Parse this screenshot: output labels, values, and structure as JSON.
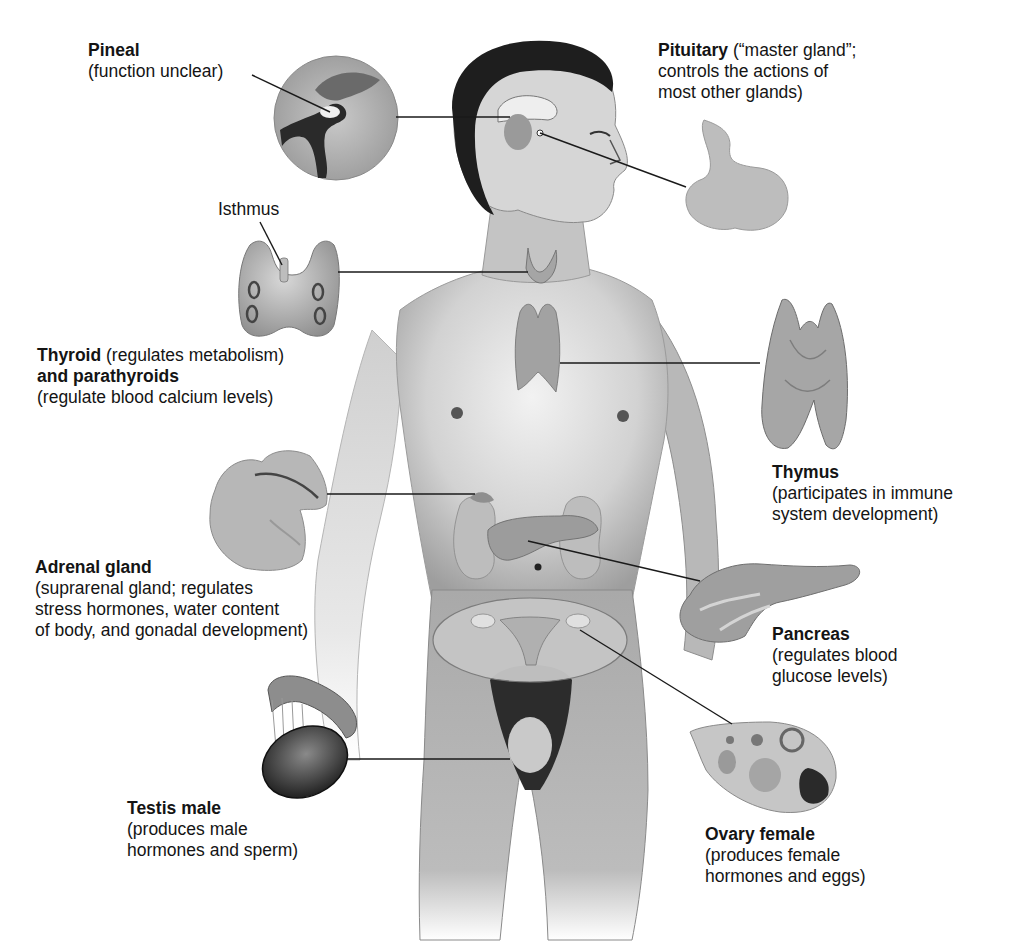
{
  "diagram": {
    "type": "anatomical-labeled-illustration",
    "colors": {
      "background": "#ffffff",
      "text": "#141414",
      "leader_line": "#1a1a1a",
      "skin_light": "#e6e6e6",
      "skin_mid": "#bdbdbd",
      "skin_dark": "#8a8a8a",
      "hair": "#1e1e1e",
      "gland": "#a8a8a8"
    },
    "labels": {
      "pineal": {
        "title": "Pineal",
        "lines": [
          "(function unclear)"
        ]
      },
      "pituitary": {
        "title": "Pituitary",
        "title_suffix": " (“master gland”;",
        "lines": [
          "controls the actions of",
          "most other glands)"
        ]
      },
      "isthmus": {
        "title": "Isthmus"
      },
      "thyroid": {
        "title": "Thyroid",
        "title_suffix": " (regulates metabolism)",
        "title2": "and parathyroids",
        "lines": [
          "(regulate blood calcium levels)"
        ]
      },
      "thymus": {
        "title": "Thymus",
        "lines": [
          "(participates in immune",
          "system development)"
        ]
      },
      "adrenal": {
        "title": "Adrenal gland",
        "lines": [
          "(suprarenal gland; regulates",
          "stress hormones, water content",
          "of body, and gonadal development)"
        ]
      },
      "pancreas": {
        "title": "Pancreas",
        "lines": [
          "(regulates blood",
          "glucose levels)"
        ]
      },
      "testis": {
        "title": "Testis male",
        "lines": [
          "(produces male",
          "hormones and sperm)"
        ]
      },
      "ovary": {
        "title": "Ovary female",
        "lines": [
          "(produces female",
          "hormones and eggs)"
        ]
      }
    },
    "leader_lines": [
      {
        "from": "pineal-label",
        "to": "pineal-inset",
        "x1": 252,
        "y1": 75,
        "x2": 330,
        "y2": 112
      },
      {
        "from": "pineal-inset",
        "to": "brain",
        "x1": 396,
        "y1": 117,
        "x2": 510,
        "y2": 117
      },
      {
        "from": "brain",
        "to": "pituitary-gland",
        "x1": 540,
        "y1": 133,
        "x2": 686,
        "y2": 187
      },
      {
        "from": "isthmus-label",
        "to": "thyroid-isthmus",
        "x1": 260,
        "y1": 220,
        "x2": 282,
        "y2": 270
      },
      {
        "from": "thyroid-inset",
        "to": "neck",
        "x1": 338,
        "y1": 272,
        "x2": 528,
        "y2": 272
      },
      {
        "from": "chest",
        "to": "thymus-gland",
        "x1": 560,
        "y1": 363,
        "x2": 760,
        "y2": 363
      },
      {
        "from": "adrenal-inset",
        "to": "kidney",
        "x1": 327,
        "y1": 494,
        "x2": 475,
        "y2": 494
      },
      {
        "from": "pancreas-body",
        "to": "pancreas-gland",
        "x1": 528,
        "y1": 541,
        "x2": 700,
        "y2": 581
      },
      {
        "from": "ovary-body",
        "to": "ovary-gland",
        "x1": 580,
        "y1": 630,
        "x2": 732,
        "y2": 724
      },
      {
        "from": "testis-inset",
        "to": "groin",
        "x1": 346,
        "y1": 759,
        "x2": 510,
        "y2": 759
      }
    ]
  }
}
